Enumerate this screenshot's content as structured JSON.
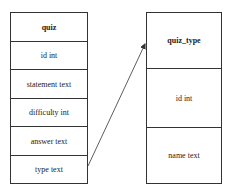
{
  "diagram": {
    "type": "er-diagram",
    "entities": [
      {
        "name": "quiz",
        "fields": [
          "id int",
          "statement text",
          "difficulty int",
          "answer text",
          "type text"
        ]
      },
      {
        "name": "quiz_type",
        "fields": [
          "id int",
          "name text"
        ]
      }
    ],
    "relations": [
      {
        "from": "quiz.type text",
        "to": "quiz_type",
        "style": "arrow"
      }
    ],
    "colors": {
      "line": "#333333",
      "background": "#ffffff",
      "text": "#222222"
    }
  }
}
